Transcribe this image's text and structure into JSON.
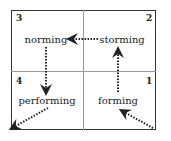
{
  "diagram": {
    "quadrants": [
      {
        "number": "1",
        "stage": "forming"
      },
      {
        "number": "2",
        "stage": "storming"
      },
      {
        "number": "3",
        "stage": "norming"
      },
      {
        "number": "4",
        "stage": "performing"
      }
    ],
    "flow": [
      "forming",
      "storming",
      "norming",
      "performing"
    ],
    "colors": {
      "line": "#333333",
      "divider": "#999999",
      "text": "#222222"
    }
  }
}
